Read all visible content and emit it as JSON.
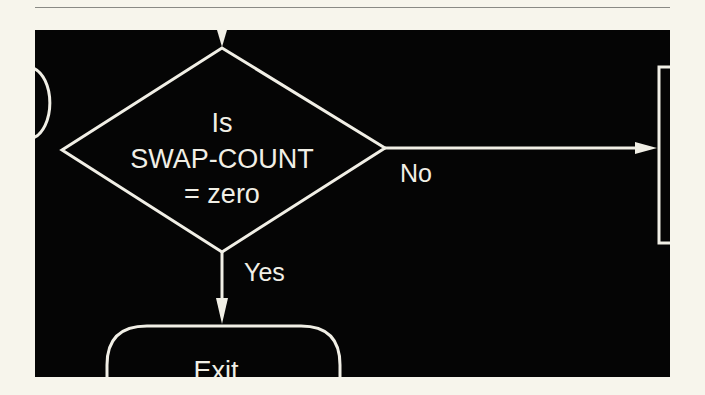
{
  "diagram": {
    "type": "flowchart",
    "decision": {
      "line1": "Is",
      "line2": "SWAP-COUNT",
      "line3": "= zero"
    },
    "edges": {
      "no_label": "No",
      "yes_label": "Yes"
    },
    "terminal": {
      "label": "Exit"
    },
    "colors": {
      "background": "#050505",
      "stroke": "#f1efe6",
      "page": "#f7f5ec"
    }
  }
}
